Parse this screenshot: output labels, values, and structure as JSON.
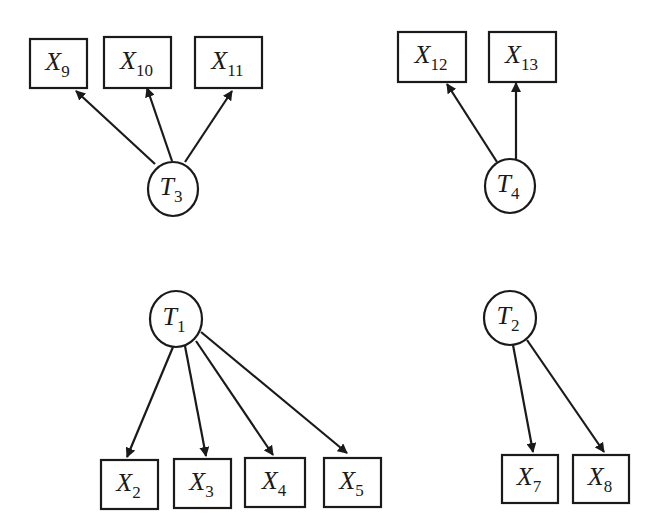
{
  "diagram": {
    "type": "measurement-model",
    "colors": {
      "stroke": "#1a1a1a",
      "background": "#ffffff"
    },
    "latent_nodes": [
      {
        "id": "T3",
        "letter": "T",
        "sub": "3",
        "cx": 173,
        "cy": 189,
        "rx": 25,
        "ry": 27
      },
      {
        "id": "T4",
        "letter": "T",
        "sub": "4",
        "cx": 510,
        "cy": 186,
        "rx": 25,
        "ry": 27
      },
      {
        "id": "T1",
        "letter": "T",
        "sub": "1",
        "cx": 176,
        "cy": 319,
        "rx": 26,
        "ry": 28
      },
      {
        "id": "T2",
        "letter": "T",
        "sub": "2",
        "cx": 510,
        "cy": 318,
        "rx": 26,
        "ry": 27
      }
    ],
    "observed_nodes": [
      {
        "id": "X9",
        "letter": "X",
        "sub": "9",
        "x": 30,
        "y": 39,
        "w": 57,
        "h": 49
      },
      {
        "id": "X10",
        "letter": "X",
        "sub": "10",
        "x": 104,
        "y": 37,
        "w": 67,
        "h": 51
      },
      {
        "id": "X11",
        "letter": "X",
        "sub": "11",
        "x": 195,
        "y": 37,
        "w": 67,
        "h": 51
      },
      {
        "id": "X12",
        "letter": "X",
        "sub": "12",
        "x": 398,
        "y": 32,
        "w": 68,
        "h": 50
      },
      {
        "id": "X13",
        "letter": "X",
        "sub": "13",
        "x": 489,
        "y": 32,
        "w": 67,
        "h": 50
      },
      {
        "id": "X2",
        "letter": "X",
        "sub": "2",
        "x": 101,
        "y": 460,
        "w": 57,
        "h": 49
      },
      {
        "id": "X3",
        "letter": "X",
        "sub": "3",
        "x": 174,
        "y": 459,
        "w": 57,
        "h": 49
      },
      {
        "id": "X4",
        "letter": "X",
        "sub": "4",
        "x": 245,
        "y": 458,
        "w": 60,
        "h": 49
      },
      {
        "id": "X5",
        "letter": "X",
        "sub": "5",
        "x": 324,
        "y": 458,
        "w": 57,
        "h": 49
      },
      {
        "id": "X7",
        "letter": "X",
        "sub": "7",
        "x": 502,
        "y": 455,
        "w": 56,
        "h": 48
      },
      {
        "id": "X8",
        "letter": "X",
        "sub": "8",
        "x": 573,
        "y": 455,
        "w": 56,
        "h": 48
      }
    ],
    "edges": [
      {
        "from": "T3",
        "to": "X9",
        "x1": 155,
        "y1": 164,
        "x2": 76,
        "y2": 91
      },
      {
        "from": "T3",
        "to": "X10",
        "x1": 172,
        "y1": 161,
        "x2": 147,
        "y2": 88
      },
      {
        "from": "T3",
        "to": "X11",
        "x1": 185,
        "y1": 162,
        "x2": 232,
        "y2": 91
      },
      {
        "from": "T4",
        "to": "X12",
        "x1": 497,
        "y1": 162,
        "x2": 447,
        "y2": 84
      },
      {
        "from": "T4",
        "to": "X13",
        "x1": 516,
        "y1": 160,
        "x2": 516,
        "y2": 83
      },
      {
        "from": "T1",
        "to": "X2",
        "x1": 173,
        "y1": 347,
        "x2": 127,
        "y2": 457
      },
      {
        "from": "T1",
        "to": "X3",
        "x1": 185,
        "y1": 346,
        "x2": 206,
        "y2": 456
      },
      {
        "from": "T1",
        "to": "X4",
        "x1": 196,
        "y1": 341,
        "x2": 273,
        "y2": 455
      },
      {
        "from": "T1",
        "to": "X5",
        "x1": 201,
        "y1": 332,
        "x2": 347,
        "y2": 453
      },
      {
        "from": "T2",
        "to": "X7",
        "x1": 513,
        "y1": 345,
        "x2": 533,
        "y2": 452
      },
      {
        "from": "T2",
        "to": "X8",
        "x1": 527,
        "y1": 340,
        "x2": 604,
        "y2": 452
      }
    ]
  }
}
